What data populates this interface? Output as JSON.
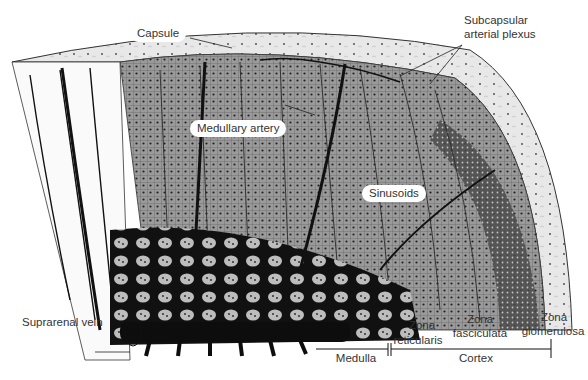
{
  "diagram": {
    "labels": {
      "capsule": "Capsule",
      "subcapsular_plexus_line1": "Subcapsular",
      "subcapsular_plexus_line2": "arterial plexus",
      "medullary_artery": "Medullary artery",
      "sinusoids": "Sinusoids",
      "suprarenal_vein": "Suprarenal vein",
      "zona_reticularis_line1": "Zona",
      "zona_reticularis_line2": "reticularis",
      "zona_fasciculata_line1": "Zona",
      "zona_fasciculata_line2": "fasciculata",
      "zona_glomerulosa_line1": "Zona",
      "zona_glomerulosa_line2": "glomerulosa",
      "medulla": "Medulla",
      "cortex": "Cortex"
    },
    "colors": {
      "ink": "#111111",
      "capsule_fill": "#e4e4e4",
      "cortex_fill": "#8a8a8a",
      "glomerulosa_fill": "#3a3a3a",
      "label_text": "#333333",
      "background": "#ffffff"
    }
  }
}
